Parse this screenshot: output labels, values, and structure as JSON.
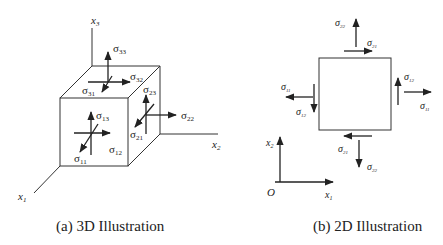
{
  "figure": {
    "panel_a": {
      "caption": "(a) 3D Illustration",
      "axes": {
        "x1": "x",
        "x1_sub": "1",
        "x2": "x",
        "x2_sub": "2",
        "x3": "x",
        "x3_sub": "3"
      },
      "stress_labels": {
        "s11": "σ",
        "s11_sub": "11",
        "s12": "σ",
        "s12_sub": "12",
        "s13": "σ",
        "s13_sub": "13",
        "s21": "σ",
        "s21_sub": "21",
        "s22": "σ",
        "s22_sub": "22",
        "s23": "σ",
        "s23_sub": "23",
        "s31": "σ",
        "s31_sub": "31",
        "s32": "σ",
        "s32_sub": "32",
        "s33": "σ",
        "s33_sub": "33"
      }
    },
    "panel_b": {
      "caption": "(b) 2D Illustration",
      "axes": {
        "x1": "x",
        "x1_sub": "1",
        "x2": "x",
        "x2_sub": "2",
        "origin": "O"
      },
      "stress_labels": {
        "top_normal": "σ",
        "top_normal_sub": "22",
        "top_shear": "σ",
        "top_shear_sub": "21",
        "left_normal": "σ",
        "left_normal_sub": "11",
        "left_shear": "σ",
        "left_shear_sub": "12",
        "right_shear": "σ",
        "right_shear_sub": "12",
        "right_normal": "σ",
        "right_normal_sub": "11",
        "bottom_shear": "σ",
        "bottom_shear_sub": "21",
        "bottom_normal": "σ",
        "bottom_normal_sub": "22"
      }
    }
  }
}
